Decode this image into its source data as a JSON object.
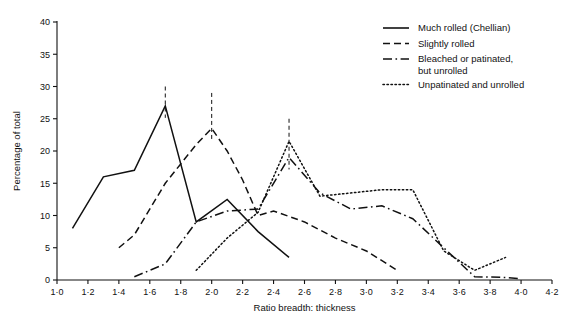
{
  "chart_data": {
    "type": "line",
    "title": "",
    "xlabel": "Ratio breadth: thickness",
    "ylabel": "Percentage of total",
    "xlim": [
      1.0,
      4.2
    ],
    "ylim": [
      0,
      40
    ],
    "xticks": [
      "1·0",
      "1·2",
      "1·4",
      "1·6",
      "1·8",
      "2·0",
      "2·2",
      "2·4",
      "2·6",
      "2·8",
      "3·0",
      "3·2",
      "3·4",
      "3·6",
      "3·8",
      "4·0",
      "4·2"
    ],
    "xtick_values": [
      1.0,
      1.2,
      1.4,
      1.6,
      1.8,
      2.0,
      2.2,
      2.4,
      2.6,
      2.8,
      3.0,
      3.2,
      3.4,
      3.6,
      3.8,
      4.0,
      4.2
    ],
    "yticks": [
      "0",
      "5",
      "10",
      "15",
      "20",
      "25",
      "30",
      "35",
      "40"
    ],
    "ytick_values": [
      0,
      5,
      10,
      15,
      20,
      25,
      30,
      35,
      40
    ],
    "grid": false,
    "legend_position": "top-right",
    "series": [
      {
        "name": "Much rolled (Chellian)",
        "style": "solid",
        "color": "#111111",
        "x": [
          1.1,
          1.3,
          1.5,
          1.7,
          1.9,
          2.1,
          2.3,
          2.5
        ],
        "values": [
          8,
          16,
          17,
          27,
          9,
          12.5,
          7.5,
          3.5
        ],
        "mean_marker_x": 1.7,
        "mean_marker_top": 30
      },
      {
        "name": "Slightly rolled",
        "style": "dashed",
        "color": "#111111",
        "x": [
          1.4,
          1.5,
          1.7,
          1.9,
          2.0,
          2.1,
          2.2,
          2.3,
          2.4,
          2.6,
          2.8,
          3.0,
          3.2
        ],
        "values": [
          5,
          7,
          15,
          21,
          23.5,
          20,
          15.5,
          10,
          10.7,
          9,
          6.5,
          4.5,
          1.5
        ],
        "mean_marker_x": 2.0,
        "mean_marker_top": 29
      },
      {
        "name": "Bleached or patinated, but unrolled",
        "style": "dashdot",
        "color": "#111111",
        "x": [
          1.5,
          1.7,
          1.9,
          2.1,
          2.3,
          2.5,
          2.7,
          2.9,
          3.1,
          3.3,
          3.5,
          3.7,
          3.9,
          4.0
        ],
        "values": [
          0.5,
          2.5,
          9,
          10.7,
          11,
          19,
          13.5,
          11,
          11.5,
          9.5,
          5,
          0.5,
          0.4,
          0.2
        ],
        "mean_marker_x": 2.5,
        "mean_marker_top": 25
      },
      {
        "name": "Unpatinated and unrolled",
        "style": "dotted",
        "color": "#111111",
        "x": [
          1.9,
          2.1,
          2.3,
          2.5,
          2.7,
          2.9,
          3.1,
          3.3,
          3.5,
          3.7,
          3.9
        ],
        "values": [
          1.5,
          6.5,
          10.5,
          21.5,
          13,
          13.5,
          14,
          14,
          4.5,
          1.5,
          3.5
        ]
      }
    ]
  },
  "legend": {
    "items": [
      {
        "label": "Much rolled (Chellian)",
        "style": "solid"
      },
      {
        "label": "Slightly rolled",
        "style": "dashed"
      },
      {
        "label": "Bleached or patinated,",
        "label2": "but unrolled",
        "style": "dashdot"
      },
      {
        "label": "Unpatinated and unrolled",
        "style": "dotted"
      }
    ]
  }
}
